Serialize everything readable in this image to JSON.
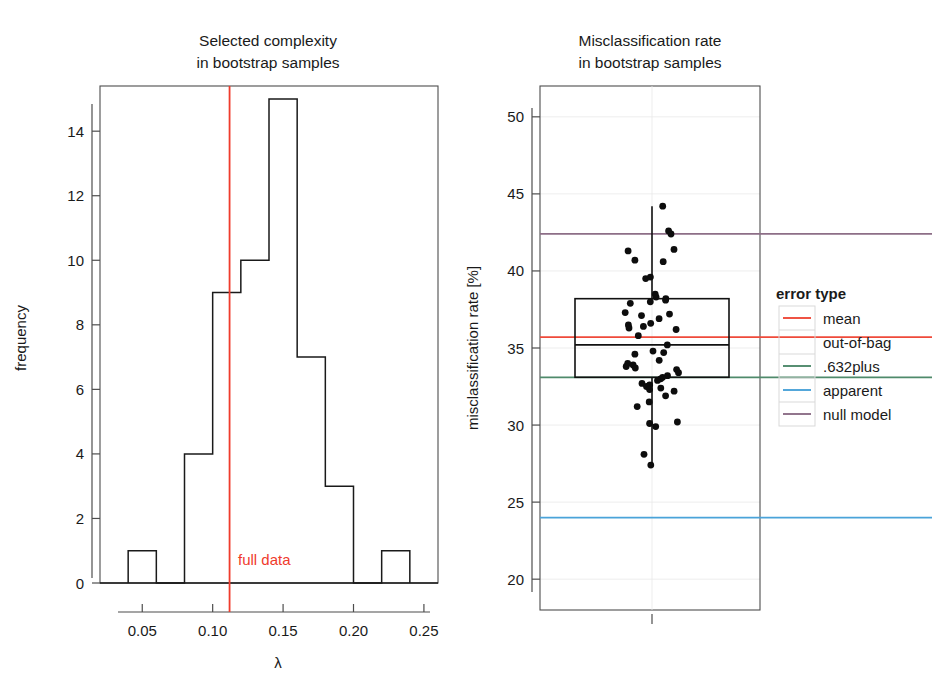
{
  "figure": {
    "width": 932,
    "height": 698,
    "background": "#ffffff"
  },
  "left_panel": {
    "title_line1": "Selected complexity",
    "title_line2": "in bootstrap samples",
    "xlabel": "λ",
    "ylabel": "frequency",
    "annotation": "full data",
    "annotation_color": "#ef3b2c"
  },
  "right_panel": {
    "title_line1": "Misclassification rate",
    "title_line2": "in bootstrap samples",
    "ylabel": "misclassification rate [%]"
  },
  "legend": {
    "title": "error type",
    "items": [
      {
        "label": "mean",
        "color": "#ef4a3a",
        "has_swatch": true
      },
      {
        "label": "out-of-bag",
        "color": "#ef4a3a",
        "has_swatch": false
      },
      {
        "label": ".632plus",
        "color": "#4f8a6b",
        "has_swatch": true
      },
      {
        "label": "apparent",
        "color": "#4aa3d9",
        "has_swatch": true
      },
      {
        "label": "null model",
        "color": "#8d6e87",
        "has_swatch": true
      }
    ]
  },
  "chart_data": [
    {
      "type": "bar",
      "name": "selected-complexity-histogram",
      "title": "Selected complexity in bootstrap samples",
      "xlabel": "λ",
      "ylabel": "frequency",
      "xlim": [
        0.02,
        0.26
      ],
      "ylim": [
        0,
        15.4
      ],
      "xticks": [
        0.05,
        0.1,
        0.15,
        0.2,
        0.25
      ],
      "xticklabels": [
        "0.05",
        "0.10",
        "0.15",
        "0.20",
        "0.25"
      ],
      "yticks": [
        0,
        2,
        4,
        6,
        8,
        10,
        12,
        14
      ],
      "yticklabels": [
        "0",
        "2",
        "4",
        "6",
        "8",
        "10",
        "12",
        "14"
      ],
      "grid": false,
      "bin_width": 0.02,
      "bins": [
        {
          "left": 0.04,
          "right": 0.06,
          "count": 1
        },
        {
          "left": 0.06,
          "right": 0.08,
          "count": 0
        },
        {
          "left": 0.08,
          "right": 0.1,
          "count": 4
        },
        {
          "left": 0.1,
          "right": 0.12,
          "count": 9
        },
        {
          "left": 0.12,
          "right": 0.14,
          "count": 10
        },
        {
          "left": 0.14,
          "right": 0.16,
          "count": 15
        },
        {
          "left": 0.16,
          "right": 0.18,
          "count": 7
        },
        {
          "left": 0.18,
          "right": 0.2,
          "count": 3
        },
        {
          "left": 0.2,
          "right": 0.22,
          "count": 0
        },
        {
          "left": 0.22,
          "right": 0.24,
          "count": 1
        }
      ],
      "categories": [
        "0.04-0.06",
        "0.06-0.08",
        "0.08-0.10",
        "0.10-0.12",
        "0.12-0.14",
        "0.14-0.16",
        "0.16-0.18",
        "0.18-0.20",
        "0.20-0.22",
        "0.22-0.24"
      ],
      "values": [
        1,
        0,
        4,
        9,
        10,
        15,
        7,
        3,
        0,
        1
      ],
      "vlines": [
        {
          "label": "full data",
          "x": 0.112,
          "color": "#ef3b2c"
        }
      ]
    },
    {
      "type": "boxplot",
      "name": "misclassification-rate-boxplot",
      "title": "Misclassification rate in bootstrap samples",
      "xlabel": "",
      "ylabel": "misclassification rate [%]",
      "ylim": [
        18.0,
        52.0
      ],
      "yticks": [
        20,
        25,
        30,
        35,
        40,
        45,
        50
      ],
      "yticklabels": [
        "20",
        "25",
        "30",
        "35",
        "40",
        "45",
        "50"
      ],
      "grid": true,
      "box": {
        "q1": 33.1,
        "median": 35.2,
        "q3": 38.2,
        "whisker_low": 27.3,
        "whisker_high": 44.2
      },
      "points": [
        44.2,
        42.6,
        42.4,
        41.4,
        41.3,
        40.7,
        40.6,
        39.6,
        39.5,
        38.5,
        38.3,
        38.2,
        38.1,
        38.0,
        37.9,
        37.3,
        37.2,
        37.1,
        36.9,
        36.6,
        36.5,
        36.4,
        36.3,
        36.2,
        35.8,
        35.2,
        34.8,
        34.7,
        34.6,
        34.2,
        34.0,
        33.9,
        33.8,
        33.7,
        33.6,
        33.4,
        33.2,
        33.1,
        33.0,
        32.9,
        32.7,
        32.6,
        32.5,
        32.4,
        32.3,
        32.2,
        31.9,
        31.5,
        31.2,
        30.2,
        30.1,
        29.9,
        28.1,
        27.4
      ],
      "hlines": [
        {
          "label": "null model",
          "y": 42.4,
          "color": "#8d6e87"
        },
        {
          "label": "mean out-of-bag",
          "y": 35.7,
          "color": "#ef4a3a"
        },
        {
          "label": ".632plus",
          "y": 33.1,
          "color": "#4f8a6b"
        },
        {
          "label": "apparent",
          "y": 24.0,
          "color": "#4aa3d9"
        }
      ],
      "legend_position": "right"
    }
  ]
}
